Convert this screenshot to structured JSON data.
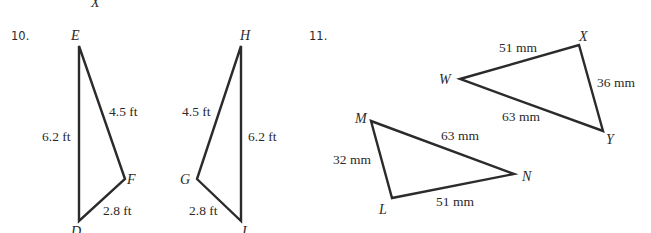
{
  "top_fragment": "X",
  "problems": [
    {
      "number": "10.",
      "triangles": [
        {
          "name": "DEF",
          "vertices": {
            "E": "E",
            "D": "D",
            "F": "F"
          },
          "sides": {
            "DE": "6.2 ft",
            "EF": "4.5 ft",
            "DF": "2.8 ft"
          }
        },
        {
          "name": "GHI",
          "vertices": {
            "H": "H",
            "I": "I",
            "G": "G"
          },
          "sides": {
            "HI": "6.2 ft",
            "GH": "4.5 ft",
            "GI": "2.8 ft"
          }
        }
      ]
    },
    {
      "number": "11.",
      "triangles": [
        {
          "name": "WXY",
          "vertices": {
            "W": "W",
            "X": "X",
            "Y": "Y"
          },
          "sides": {
            "WX": "51 mm",
            "XY": "36 mm",
            "WY": "63 mm"
          }
        },
        {
          "name": "LMN",
          "vertices": {
            "M": "M",
            "N": "N",
            "L": "L"
          },
          "sides": {
            "MN": "63 mm",
            "LM": "32 mm",
            "LN": "51 mm"
          }
        }
      ]
    }
  ]
}
